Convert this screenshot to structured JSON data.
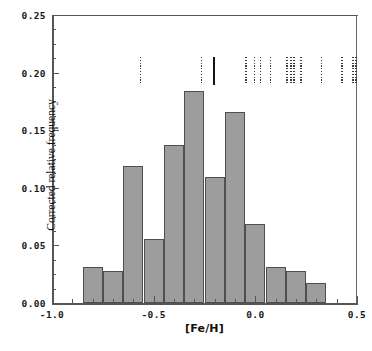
{
  "chart_data": {
    "type": "bar",
    "title": "",
    "xlabel": "[Fe/H]",
    "ylabel": "Corrected relative frequency",
    "xlim": [
      -1.0,
      0.5
    ],
    "ylim": [
      0.0,
      0.25
    ],
    "grid": false,
    "legend": "none",
    "bin_width": 0.1,
    "bin_edges": [
      -0.85,
      -0.75,
      -0.65,
      -0.55,
      -0.45,
      -0.35,
      -0.25,
      -0.15,
      -0.05,
      0.05,
      0.15,
      0.25,
      0.35
    ],
    "categories": [
      "-0.85 to -0.75",
      "-0.75 to -0.65",
      "-0.65 to -0.55",
      "-0.55 to -0.45",
      "-0.45 to -0.35",
      "-0.35 to -0.25",
      "-0.25 to -0.15",
      "-0.15 to -0.05",
      "-0.05 to 0.05",
      "0.05 to 0.15",
      "0.15 to 0.25",
      "0.25 to 0.35"
    ],
    "values": [
      0.031,
      0.028,
      0.119,
      0.056,
      0.137,
      0.184,
      0.109,
      0.166,
      0.069,
      0.031,
      0.028,
      0.017
    ],
    "x_ticks": [
      {
        "value": -1.0,
        "label": "-1.0"
      },
      {
        "value": -0.5,
        "label": "-0.5"
      },
      {
        "value": 0.0,
        "label": "0.0"
      },
      {
        "value": 0.5,
        "label": "0.5"
      }
    ],
    "x_minor_step": 0.1,
    "y_ticks": [
      {
        "value": 0.0,
        "label": "0.00"
      },
      {
        "value": 0.05,
        "label": "0.05"
      },
      {
        "value": 0.1,
        "label": "0.10"
      },
      {
        "value": 0.15,
        "label": "0.15"
      },
      {
        "value": 0.2,
        "label": "0.20"
      },
      {
        "value": 0.25,
        "label": "0.25"
      }
    ],
    "y_minor_step": 0.0125,
    "annotations": {
      "description": "Vertical rug / tick marks drawn near y=0.205 indicating individual object metallicities",
      "rug_y": 0.205,
      "rug_marks": [
        {
          "x": -0.565,
          "style": "dashed"
        },
        {
          "x": -0.265,
          "style": "dashed"
        },
        {
          "x": -0.205,
          "style": "solid"
        },
        {
          "x": -0.045,
          "style": "dashed"
        },
        {
          "x": -0.005,
          "style": "dashed"
        },
        {
          "x": 0.025,
          "style": "dashed"
        },
        {
          "x": 0.075,
          "style": "dashed"
        },
        {
          "x": 0.155,
          "style": "dashed"
        },
        {
          "x": 0.175,
          "style": "dashed"
        },
        {
          "x": 0.19,
          "style": "dashed"
        },
        {
          "x": 0.225,
          "style": "dashed"
        },
        {
          "x": 0.325,
          "style": "dashed"
        },
        {
          "x": 0.425,
          "style": "dashed"
        },
        {
          "x": 0.48,
          "style": "dashed"
        },
        {
          "x": 0.495,
          "style": "dashed"
        }
      ]
    },
    "colors": {
      "bar_fill": "#9d9d9d",
      "bar_edge": "#4f4f4f",
      "axis": "#555555",
      "text": "#1a1a1a",
      "rug_dashed": "#3a3a3a",
      "rug_solid": "#141414",
      "background": "#ffffff"
    }
  }
}
